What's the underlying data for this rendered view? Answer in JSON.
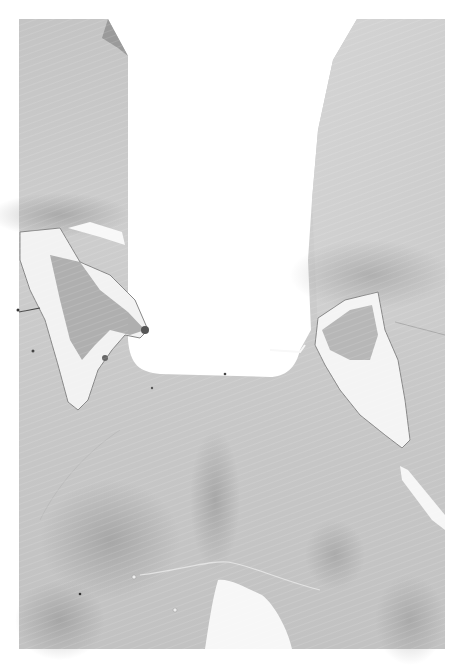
{
  "image": {
    "kind": "grayscale histology micrograph",
    "subject": "coronal brain tissue section with a rectangular lesion cavity",
    "colors": {
      "background": "#ffffff",
      "tissue_base": "#c9c9c9",
      "tissue_light": "#dedede",
      "tissue_dark": "#a9a9a9",
      "damaged_region": "#8f8f8f",
      "folded_corner": "#9a9a9a"
    },
    "regions": [
      "left-tissue-column",
      "right-tissue-column",
      "central-cavity",
      "left-damaged-pocket",
      "right-damaged-pocket",
      "bottom-midline-cavity",
      "right-edge-tear"
    ]
  }
}
